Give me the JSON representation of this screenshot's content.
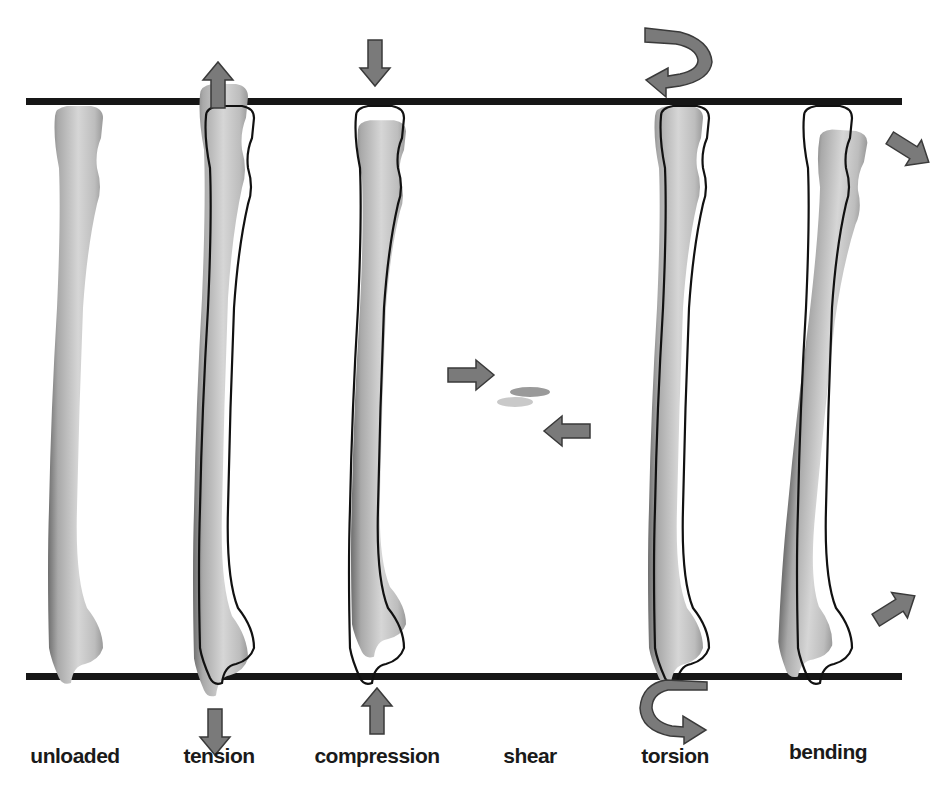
{
  "figure": {
    "colors": {
      "reference_line": "#161616",
      "bone_light": "#d9d9d9",
      "bone_mid": "#b3b3b3",
      "bone_dark": "#6e6e6e",
      "arrow_fill": "#7a7a7a",
      "arrow_stroke": "#3a3a3a",
      "outline": "#111111",
      "label": "#1a1a1a"
    },
    "panels": [
      {
        "id": "unloaded",
        "label": "unloaded",
        "x": 75,
        "arrows": []
      },
      {
        "id": "tension",
        "label": "tension",
        "x": 218,
        "arrows": [
          "arrow-up-top",
          "arrow-down-bottom"
        ]
      },
      {
        "id": "compression",
        "label": "compression",
        "x": 377,
        "arrows": [
          "arrow-down-top",
          "arrow-up-bottom"
        ]
      },
      {
        "id": "shear",
        "label": "shear",
        "x": 530,
        "arrows": [
          "arrow-right-upper",
          "arrow-left-lower"
        ]
      },
      {
        "id": "torsion",
        "label": "torsion",
        "x": 675,
        "arrows": [
          "curved-arrow-top",
          "curved-arrow-bottom"
        ]
      },
      {
        "id": "bending",
        "label": "bending",
        "x": 828,
        "arrows": [
          "arrow-diagonal-down-right",
          "arrow-diagonal-up-right"
        ]
      }
    ]
  }
}
